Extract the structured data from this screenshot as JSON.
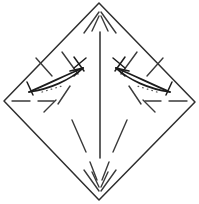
{
  "figure": {
    "background_color": "#ffffff",
    "line_color": "#2e2e2e",
    "crease_color": "#3a3a3a",
    "arrow_color": "#1c1c1c",
    "dotted_color": "#5a5a5a",
    "width": 199,
    "height": 204
  },
  "chart_data": {
    "type": "diagram",
    "xlabel": "",
    "ylabel": "",
    "grid": false,
    "legend": "none",
    "xlim": [
      0,
      199
    ],
    "ylim": [
      0,
      204
    ],
    "shapes": [
      {
        "name": "outer-diamond",
        "kind": "polygon",
        "style": "solid",
        "points": [
          [
            99,
            3
          ],
          [
            195,
            102
          ],
          [
            99,
            200
          ],
          [
            4,
            101
          ]
        ]
      },
      {
        "name": "center-vertical-crease",
        "kind": "line",
        "style": "solid",
        "points": [
          [
            100,
            32
          ],
          [
            100,
            158
          ]
        ]
      }
    ],
    "creases": [
      {
        "name": "top-crease-left-outer",
        "style": "dashed",
        "points": [
          [
            99,
            12
          ],
          [
            84,
            32
          ]
        ]
      },
      {
        "name": "top-crease-left-inner",
        "style": "dashed",
        "points": [
          [
            99,
            14
          ],
          [
            92,
            30
          ]
        ]
      },
      {
        "name": "top-crease-right-inner",
        "style": "dashed",
        "points": [
          [
            101,
            14
          ],
          [
            108,
            30
          ]
        ]
      },
      {
        "name": "top-crease-right-outer",
        "style": "dashed",
        "points": [
          [
            101,
            12
          ],
          [
            116,
            32
          ]
        ]
      },
      {
        "name": "bottom-crease-left-outer",
        "style": "dashed",
        "points": [
          [
            99,
            191
          ],
          [
            84,
            170
          ]
        ]
      },
      {
        "name": "bottom-crease-left-inner",
        "style": "dashed",
        "points": [
          [
            99,
            189
          ],
          [
            92,
            172
          ]
        ]
      },
      {
        "name": "bottom-crease-right-inner",
        "style": "dashed",
        "points": [
          [
            101,
            189
          ],
          [
            108,
            172
          ]
        ]
      },
      {
        "name": "bottom-crease-right-outer",
        "style": "dashed",
        "points": [
          [
            101,
            191
          ],
          [
            116,
            170
          ]
        ]
      },
      {
        "name": "left-crease-horizontal",
        "style": "dashed",
        "points": [
          [
            12,
            101
          ],
          [
            46,
            101
          ]
        ]
      },
      {
        "name": "right-crease-horizontal",
        "style": "dashed",
        "points": [
          [
            153,
            101
          ],
          [
            187,
            101
          ]
        ]
      },
      {
        "name": "left-diagonal-upper",
        "style": "dashed",
        "points": [
          [
            36,
            60
          ],
          [
            82,
            110
          ]
        ]
      },
      {
        "name": "left-diagonal-lower",
        "style": "dashed",
        "points": [
          [
            58,
            128
          ],
          [
            82,
            104
          ]
        ]
      },
      {
        "name": "right-diagonal-upper",
        "style": "dashed",
        "points": [
          [
            163,
            60
          ],
          [
            117,
            110
          ]
        ]
      },
      {
        "name": "right-diagonal-lower",
        "style": "dashed",
        "points": [
          [
            141,
            128
          ],
          [
            117,
            104
          ]
        ]
      },
      {
        "name": "left-spoke-to-bottom",
        "style": "dashed",
        "points": [
          [
            74,
            118
          ],
          [
            96,
            176
          ]
        ]
      },
      {
        "name": "right-spoke-to-bottom",
        "style": "dashed",
        "points": [
          [
            125,
            118
          ],
          [
            104,
            176
          ]
        ]
      }
    ],
    "arrows": [
      {
        "name": "left-fold-arrow",
        "direction": "right-inward",
        "tip": [
          82,
          68
        ],
        "tail": [
          30,
          93
        ],
        "style": "curved-leaf"
      },
      {
        "name": "right-fold-arrow",
        "direction": "left-inward",
        "tip": [
          117,
          68
        ],
        "tail": [
          169,
          93
        ],
        "style": "curved-leaf"
      }
    ],
    "markers": [
      {
        "name": "left-cross-mark",
        "position": [
          80,
          64
        ],
        "kind": "x-tick"
      },
      {
        "name": "right-cross-mark",
        "position": [
          119,
          64
        ],
        "kind": "x-tick"
      },
      {
        "name": "left-tail-tick",
        "position": [
          32,
          86
        ],
        "kind": "bar-tick"
      },
      {
        "name": "right-tail-tick",
        "position": [
          167,
          86
        ],
        "kind": "bar-tick"
      },
      {
        "name": "left-dotted-accent",
        "position": [
          52,
          88
        ],
        "kind": "dotted"
      },
      {
        "name": "right-dotted-accent",
        "position": [
          147,
          88
        ],
        "kind": "dotted"
      }
    ]
  }
}
